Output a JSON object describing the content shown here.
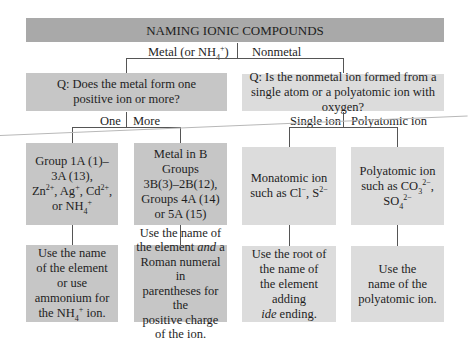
{
  "title": "NAMING IONIC COMPOUNDS",
  "branches_top": {
    "metal_label": "Metal (or NH4+)",
    "nonmetal_label": "Nonmetal"
  },
  "questions": {
    "metal": "Q: Does the metal form one positive ion or more?",
    "nonmetal": "Q: Is the nonmetal ion formed from a single atom or a polyatomic ion with oxygen?"
  },
  "branches_metal": {
    "one": "One",
    "more": "More"
  },
  "branches_nonmetal": {
    "single": "Single ion",
    "poly": "Polyatomic ion"
  },
  "categories": [
    {
      "id": "group1a",
      "text": "Group 1A (1)–3A (13), Zn2+, Ag+, Cd2+, or NH4+"
    },
    {
      "id": "bgroups",
      "text": "Metal in B Groups 3B(3)–2B(12), Groups 4A (14) or 5A (15)"
    },
    {
      "id": "monatomic",
      "text": "Monatomic ion such as Cl−, S2−"
    },
    {
      "id": "polyatomic",
      "text": "Polyatomic ion such as CO32−, SO42−"
    }
  ],
  "rules": [
    {
      "id": "rule-group1a",
      "text": "Use the name of the element or use ammonium for the NH4+ ion."
    },
    {
      "id": "rule-bgroups",
      "text": "Use the name of the element and a Roman numeral in parentheses for the positive charge of the ion."
    },
    {
      "id": "rule-monatomic",
      "text": "Use the root of the name of the element adding ide ending."
    },
    {
      "id": "rule-polyatomic",
      "text": "Use the name of the polyatomic ion."
    }
  ],
  "colors": {
    "title_bg": "#a9a9a9",
    "metal_bg": "#c6c6c6",
    "nonmetal_bg": "#dcdcdc",
    "line": "#555555"
  }
}
